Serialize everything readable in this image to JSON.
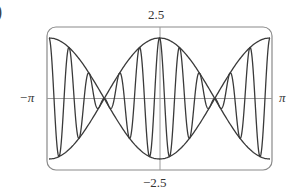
{
  "chart_data": {
    "type": "line",
    "title": "",
    "panel_label_fragment": ")",
    "xlabel": "",
    "ylabel": "",
    "xlim": [
      -3.14159,
      3.14159
    ],
    "ylim": [
      -2.5,
      2.5
    ],
    "x_tick_labels": {
      "min": "−π",
      "max": "π"
    },
    "y_tick_labels": {
      "max": "2.5",
      "min": "−2.5"
    },
    "grid": false,
    "legend": null,
    "series": [
      {
        "name": "upper envelope",
        "expression": "2.5·cos(x)",
        "style": "curve"
      },
      {
        "name": "lower envelope",
        "expression": "−2.5·cos(x)",
        "style": "curve"
      },
      {
        "name": "oscillation",
        "expression": "2.5·cos(x)·cos(11x)",
        "frequency": 11,
        "style": "curve"
      }
    ],
    "envelope_crossings_x": [
      -1.5708,
      1.5708
    ],
    "values_at_key_points": [
      {
        "x": -3.14159,
        "y": 2.5
      },
      {
        "x": 0,
        "y": 2.5
      },
      {
        "x": 3.14159,
        "y": 2.5
      }
    ]
  },
  "colors": {
    "curve": "#3a3a3a",
    "frame": "#888888",
    "axis": "#999999"
  }
}
